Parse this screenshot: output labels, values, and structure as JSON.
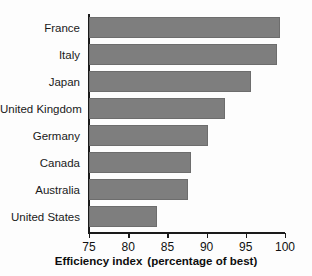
{
  "chart_data": {
    "type": "bar",
    "orientation": "horizontal",
    "title": "",
    "subtitle": "",
    "xlabel": "Efficiency index  (percentage of best)",
    "xlabel_part1": "Efficiency index",
    "xlabel_part2": "(percentage of best)",
    "ylabel": "",
    "categories": [
      "France",
      "Italy",
      "Japan",
      "United Kingdom",
      "Germany",
      "Canada",
      "Australia",
      "United States"
    ],
    "values": [
      99.3,
      99.0,
      95.6,
      92.4,
      90.2,
      88.0,
      87.6,
      83.7
    ],
    "xlim": [
      75,
      100
    ],
    "xticks": [
      75,
      80,
      85,
      90,
      95,
      100
    ],
    "xtick_labels": [
      "75",
      "80",
      "85",
      "90",
      "95",
      "100"
    ],
    "grid": false,
    "legend": null,
    "bar_color": "#7e7e7e",
    "bar_border_color": "#6d6d6d",
    "axis_color": "#1a1a1a",
    "background_color": "#fdfdfd",
    "series": [
      {
        "name": "Efficiency index",
        "values": [
          99.3,
          99.0,
          95.6,
          92.4,
          90.2,
          88.0,
          87.6,
          83.7
        ]
      }
    ]
  }
}
